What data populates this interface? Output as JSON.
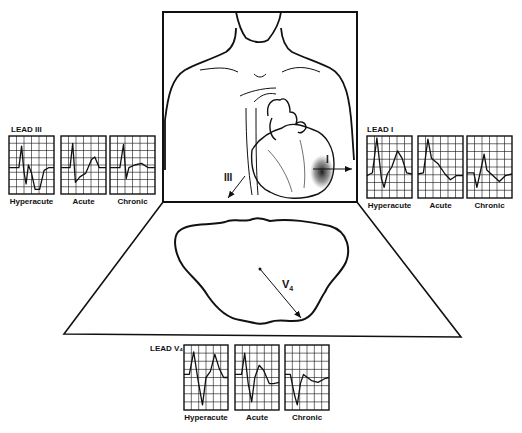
{
  "panels": [
    {
      "id": "lead-iii",
      "title": "LEAD III",
      "traces": [
        {
          "label": "Hyperacute",
          "kind": "iii-hyper"
        },
        {
          "label": "Acute",
          "kind": "iii-acute"
        },
        {
          "label": "Chronic",
          "kind": "iii-chronic"
        }
      ]
    },
    {
      "id": "lead-i",
      "title": "LEAD I",
      "traces": [
        {
          "label": "Hyperacute",
          "kind": "i-hyper"
        },
        {
          "label": "Acute",
          "kind": "i-acute"
        },
        {
          "label": "Chronic",
          "kind": "i-chronic"
        }
      ]
    },
    {
      "id": "lead-v4",
      "title": "LEAD V₄",
      "traces": [
        {
          "label": "Hyperacute",
          "kind": "v4-hyper"
        },
        {
          "label": "Acute",
          "kind": "v4-acute"
        },
        {
          "label": "Chronic",
          "kind": "v4-chronic"
        }
      ]
    }
  ],
  "vectors": {
    "lead_i": "I",
    "lead_iii": "III",
    "lead_v4": "V",
    "lead_v4_sub": "4"
  },
  "colors": {
    "ink": "#111111",
    "background": "#ffffff",
    "infarct_shade": "#222222"
  }
}
